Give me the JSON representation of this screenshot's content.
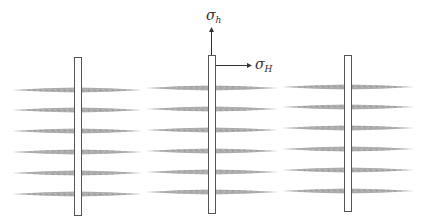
{
  "diagram": {
    "type": "hydraulic-fracture-schematic",
    "colors": {
      "background": "#ffffff",
      "fracture_fill": "#a9a9a9",
      "wellbore_stroke": "#555555",
      "wellbore_fill": "#ffffff",
      "arrow": "#333333"
    },
    "stress_labels": {
      "min_horizontal": {
        "symbol": "σ",
        "subscript": "h"
      },
      "max_horizontal": {
        "symbol": "σ",
        "subscript": "H"
      }
    },
    "wellbores": [
      {
        "id": "well-1",
        "x": 74,
        "y_top": 57,
        "y_bottom": 215,
        "width": 7,
        "fractures": {
          "x_left": 12,
          "x_right": 142,
          "y": [
            90,
            110,
            131,
            152,
            173,
            194
          ]
        }
      },
      {
        "id": "well-2",
        "x": 208,
        "y_top": 55,
        "y_bottom": 213,
        "width": 7,
        "fractures": {
          "x_left": 146,
          "x_right": 278,
          "y": [
            88,
            109,
            130,
            151,
            172,
            192
          ]
        }
      },
      {
        "id": "well-3",
        "x": 344,
        "y_top": 55,
        "y_bottom": 211,
        "width": 7,
        "fractures": {
          "x_left": 282,
          "x_right": 414,
          "y": [
            87,
            107,
            128,
            149,
            170,
            191
          ]
        }
      }
    ],
    "arrows": {
      "sigma_h": {
        "x": 211,
        "y_start": 55,
        "y_end": 27
      },
      "sigma_H": {
        "y": 65,
        "x_start": 216,
        "x_end": 252
      }
    }
  }
}
